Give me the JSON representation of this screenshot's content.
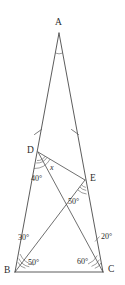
{
  "figure": {
    "kind": "euclidean-geometry-diagram",
    "stroke_color": "#4a4a4a",
    "label_color": "#2b2b2b",
    "background": "#ffffff",
    "vertices": [
      {
        "id": "A",
        "label": "A",
        "x": 59,
        "y": 33
      },
      {
        "id": "B",
        "label": "B",
        "x": 15,
        "y": 272
      },
      {
        "id": "C",
        "label": "C",
        "x": 103,
        "y": 272
      },
      {
        "id": "D",
        "label": "D",
        "x": 38,
        "y": 152
      },
      {
        "id": "E",
        "label": "E",
        "x": 85,
        "y": 180
      }
    ],
    "vertex_labels": [
      {
        "id": "A",
        "text": "A",
        "x": 55,
        "y": 18
      },
      {
        "id": "B",
        "text": "B",
        "x": 4,
        "y": 266
      },
      {
        "id": "C",
        "text": "C",
        "x": 108,
        "y": 265
      },
      {
        "id": "D",
        "text": "D",
        "x": 27,
        "y": 146
      },
      {
        "id": "E",
        "text": "E",
        "x": 90,
        "y": 174
      }
    ],
    "segments": [
      {
        "name": "AB",
        "from": "A",
        "to": "B",
        "style": "edge"
      },
      {
        "name": "AC",
        "from": "A",
        "to": "C",
        "style": "edge"
      },
      {
        "name": "BC",
        "from": "B",
        "to": "C",
        "style": "edge"
      },
      {
        "name": "DE",
        "from": "D",
        "to": "E",
        "style": "cevian"
      },
      {
        "name": "BE",
        "from": "B",
        "to": "E",
        "style": "cevian"
      },
      {
        "name": "DC",
        "from": "D",
        "to": "C",
        "style": "cevian"
      }
    ],
    "tick_marks": [
      {
        "name": "tick-AD",
        "on": "AB",
        "x": 38,
        "y": 132
      },
      {
        "name": "tick-AE",
        "on": "AC",
        "x": 75,
        "y": 132
      }
    ],
    "angle_labels": [
      {
        "name": "angle-BDC",
        "text": "40°",
        "x": 31,
        "y": 175,
        "at": "D"
      },
      {
        "name": "angle-x",
        "text": "x",
        "x": 50,
        "y": 164,
        "at": "D",
        "unknown": true
      },
      {
        "name": "angle-CEB",
        "text": "50°",
        "x": 68,
        "y": 198,
        "at": "E"
      },
      {
        "name": "angle-DBE",
        "text": "30°",
        "x": 18,
        "y": 234,
        "at": "B"
      },
      {
        "name": "angle-EBC",
        "text": "50°",
        "x": 28,
        "y": 259,
        "at": "B"
      },
      {
        "name": "angle-DCB",
        "text": "60°",
        "x": 77,
        "y": 258,
        "at": "C"
      },
      {
        "name": "angle-DCA",
        "text": "20°",
        "x": 101,
        "y": 233,
        "at": "C"
      }
    ],
    "unknown_symbol": "x",
    "degree_symbol": "°"
  }
}
